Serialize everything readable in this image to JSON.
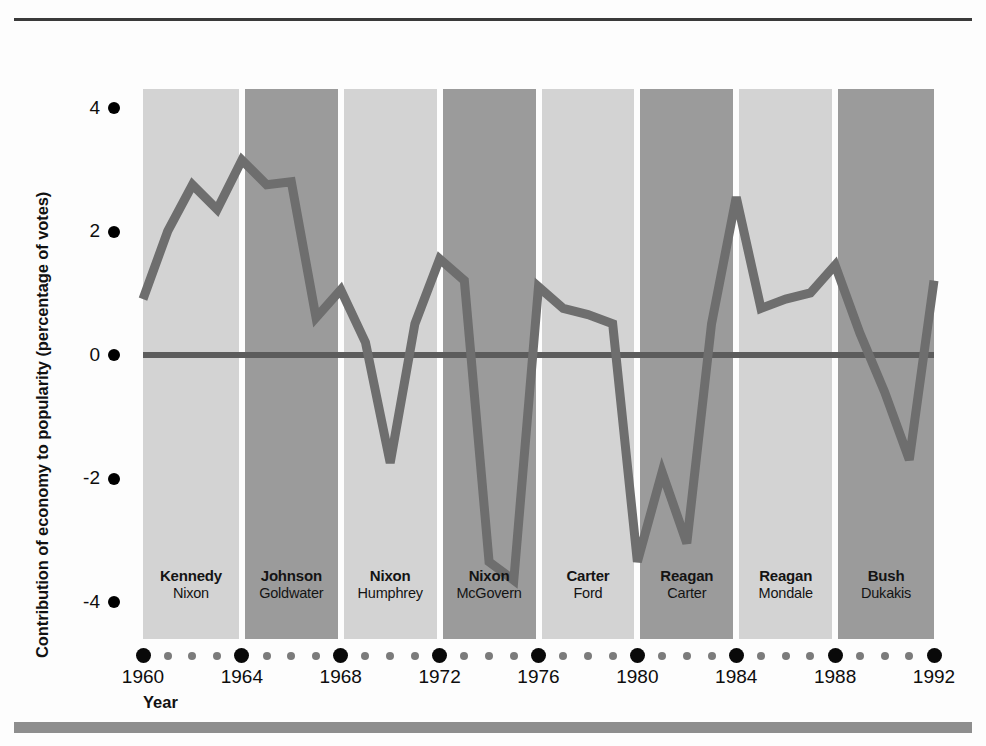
{
  "figure": {
    "y_axis_title": "Contribution of economy to popularity (percentage of votes)",
    "x_axis_title": "Year",
    "line_color": "#6e6e6e",
    "zero_line_color": "#5c5c5c",
    "band_light_color": "#d3d3d3",
    "band_dark_color": "#9b9b9b",
    "tick_major_color": "#090909",
    "tick_minor_color": "#7b7b7b"
  },
  "chart_data": {
    "type": "line",
    "title": "",
    "xlabel": "Year",
    "ylabel": "Contribution of economy to popularity (percentage of votes)",
    "xlim": [
      1960,
      1992
    ],
    "ylim": [
      -4.6,
      4.3
    ],
    "grid": false,
    "legend": null,
    "y_ticks": [
      4,
      2,
      0,
      -2,
      -4
    ],
    "y_tick_labels": [
      "4",
      "2",
      "0",
      "-2",
      "-4"
    ],
    "x_ticks_major": [
      1960,
      1964,
      1968,
      1972,
      1976,
      1980,
      1984,
      1988,
      1992
    ],
    "x_tick_labels": [
      "1960",
      "1964",
      "1968",
      "1972",
      "1976",
      "1980",
      "1984",
      "1988",
      "1992"
    ],
    "x_ticks_minor": [
      1961,
      1962,
      1963,
      1965,
      1966,
      1967,
      1969,
      1970,
      1971,
      1973,
      1974,
      1975,
      1977,
      1978,
      1979,
      1981,
      1982,
      1983,
      1985,
      1986,
      1987,
      1989,
      1990,
      1991
    ],
    "series": [
      {
        "name": "Contribution of economy to popularity",
        "x": [
          1960,
          1961,
          1962,
          1963,
          1964,
          1965,
          1966,
          1967,
          1968,
          1969,
          1970,
          1971,
          1972,
          1973,
          1974,
          1975,
          1976,
          1977,
          1978,
          1979,
          1980,
          1981,
          1982,
          1983,
          1984,
          1985,
          1986,
          1987,
          1988,
          1989,
          1990,
          1991,
          1992
        ],
        "values": [
          0.9,
          2.0,
          2.75,
          2.35,
          3.15,
          2.75,
          2.8,
          0.6,
          1.05,
          0.2,
          -1.75,
          0.5,
          1.55,
          1.2,
          -3.35,
          -3.65,
          1.1,
          0.75,
          0.65,
          0.5,
          -3.35,
          -1.9,
          -3.05,
          0.5,
          2.55,
          0.75,
          0.9,
          1.0,
          1.45,
          0.35,
          -0.6,
          -1.7,
          1.2
        ]
      }
    ],
    "election_bands": [
      {
        "start": 1960,
        "end": 1964,
        "shade": "light",
        "winner": "Kennedy",
        "loser": "Nixon"
      },
      {
        "start": 1964,
        "end": 1968,
        "shade": "dark",
        "winner": "Johnson",
        "loser": "Goldwater"
      },
      {
        "start": 1968,
        "end": 1972,
        "shade": "light",
        "winner": "Nixon",
        "loser": "Humphrey"
      },
      {
        "start": 1972,
        "end": 1976,
        "shade": "dark",
        "winner": "Nixon",
        "loser": "McGovern"
      },
      {
        "start": 1976,
        "end": 1980,
        "shade": "light",
        "winner": "Carter",
        "loser": "Ford"
      },
      {
        "start": 1980,
        "end": 1984,
        "shade": "dark",
        "winner": "Reagan",
        "loser": "Carter"
      },
      {
        "start": 1984,
        "end": 1988,
        "shade": "light",
        "winner": "Reagan",
        "loser": "Mondale"
      },
      {
        "start": 1988,
        "end": 1992,
        "shade": "dark",
        "winner": "Bush",
        "loser": "Dukakis"
      }
    ]
  }
}
